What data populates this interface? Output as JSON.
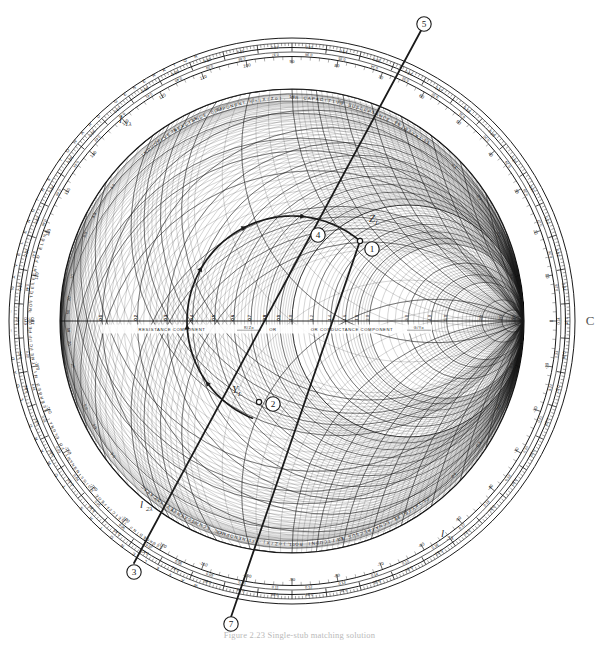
{
  "figure": {
    "kind": "smith-chart",
    "caption": "Figure 2.23  Single-stub matching solution",
    "background": "#ffffff",
    "ink": "#1a1a1a"
  },
  "chart_data": {
    "type": "scatter",
    "xlabel": "RESISTANCE COMPONENT (R/Zo), OR CONDUCTANCE COMPONENT (G/Yo)",
    "ylabel": "",
    "grid": true,
    "legend_position": "none",
    "axis_labels": {
      "center_axis": "RESISTANCE COMPONENT",
      "center_axis_paren": "R/Zo",
      "center_axis_or": "OR CONDUCTANCE COMPONENT",
      "center_axis_paren2": "G/Yo",
      "upper_rim": "INDUCTIVE REACTANCE COMPONENT (+jX/Zo), OR CAPACITIVE SUSCEPTANCE (+jB/Yo)",
      "lower_rim": "CAPACITIVE REACTANCE COMPONENT (-jX/Zo), OR INDUCTIVE SUSCEPTANCE (-jB/Yo)",
      "outer_ring_left": "WAVELENGTHS TOWARD GENERATOR",
      "outer_ring_right": "WAVELENGTHS TOWARD LOAD",
      "angle_ring_upper": "ANGLE OF REFLECTION COEFFICIENT IN DEGREES",
      "angle_ring_lower": "ANGLE OF TRANSMISSION COEFFICIENT IN DEGREES",
      "right_edge_letter": "C"
    },
    "center": {
      "x": 292,
      "y": 321
    },
    "outer_radius": 283,
    "resistance_ticks_right": [
      "0.1",
      "0.2",
      "0.3",
      "0.4",
      "0.5",
      "0.6",
      "0.7",
      "0.8",
      "0.9",
      "1.0",
      "1.2",
      "1.4",
      "1.6",
      "1.8",
      "2.0",
      "3.0",
      "4.0",
      "5.0",
      "10",
      "20",
      "50"
    ],
    "resistance_ticks_left_labels": [
      "0.9",
      "0.8",
      "0.7",
      "0.6",
      "0.5",
      "0.4",
      "0.3",
      "0.2",
      "0.1",
      "0"
    ],
    "reactance_labels": [
      "0.1",
      "0.2",
      "0.3",
      "0.4",
      "0.5",
      "0.6",
      "0.8",
      "1.0",
      "1.2",
      "1.4",
      "1.6",
      "1.8",
      "2.0",
      "3.0",
      "4.0",
      "5.0",
      "10",
      "20",
      "50"
    ],
    "wavelength_scale_top": [
      "0.09",
      "0.10",
      "0.11",
      "0.12",
      "0.13",
      "0.14",
      "0.15"
    ],
    "wavelength_scale_bottom": [
      "0.36",
      "0.37",
      "0.38",
      "0.39",
      "0.40"
    ],
    "angle_scale_top": [
      "100",
      "90",
      "80",
      "70"
    ],
    "swr_circle_radius": 152,
    "points": [
      {
        "id": 1,
        "label": "1",
        "x": 360,
        "y": 241,
        "kind": "open-dot",
        "note": "Z_L on SWR circle"
      },
      {
        "id": 2,
        "label": "2",
        "x": 259,
        "y": 402,
        "kind": "open-dot",
        "note": "Y_L on SWR circle"
      },
      {
        "id": 4,
        "label": "4",
        "x": 320,
        "y": 231,
        "kind": "open-dot",
        "note": "intersection with 1+jb circle"
      },
      {
        "id": 3,
        "label": "3",
        "x": 134,
        "y": 563,
        "kind": "rim-marker",
        "note": "rim reading, lower left"
      },
      {
        "id": 5,
        "label": "5",
        "x": 424,
        "y": 25,
        "kind": "rim-marker",
        "note": "rim reading, upper right"
      },
      {
        "id": 7,
        "label": "7",
        "x": 231,
        "y": 617,
        "kind": "rim-marker",
        "note": "rim reading, bottom"
      }
    ],
    "annotations": [
      {
        "text": "Z",
        "sub": "L",
        "x": 369,
        "y": 222
      },
      {
        "text": "Y",
        "sub": "L",
        "x": 232,
        "y": 393
      },
      {
        "text": "l",
        "sub": "1λ",
        "x": 119,
        "y": 123
      },
      {
        "text": "l",
        "sub": "2λ",
        "x": 140,
        "y": 508
      },
      {
        "text": "l",
        "sub": "3λ",
        "x": 441,
        "y": 537
      }
    ],
    "chords": [
      {
        "name": "chord-5-3",
        "from": [
          424,
          25
        ],
        "to": [
          134,
          563
        ]
      },
      {
        "name": "chord-1-7",
        "from": [
          360,
          241
        ],
        "to": [
          231,
          617
        ]
      }
    ],
    "arc": {
      "name": "constant-swr-arc",
      "from_point": 2,
      "to_point": 1,
      "direction": "counterclockwise",
      "arrow_count": 5
    }
  },
  "markers": {
    "m1": "1",
    "m2": "2",
    "m3": "3",
    "m4": "4",
    "m5": "5",
    "m7": "7"
  },
  "labels": {
    "zl_main": "Z",
    "zl_sub": "L",
    "yl_main": "Y",
    "yl_sub": "L",
    "l1_main": "l",
    "l1_sub": "1λ",
    "l2_main": "l",
    "l2_sub": "2λ",
    "l3_main": "l",
    "l3_sub": "3λ",
    "edge_c": "C"
  },
  "rim_text": {
    "wavelengths_gen": "WAVELENGTHS TOWARD GENERATOR",
    "wavelengths_load": "WAVELENGTHS TOWARD LOAD",
    "angle_refl": "ANGLE OF REFLECTION COEFFICIENT IN DEGREES",
    "angle_trans": "ANGLE OF TRANSMISSION COEFFICIENT IN DEGREES",
    "inductive": "INDUCTIVE REACTANCE COMPONENT (+jX/Zo), OR CAPACITIVE SUSCEPTANCE (+jB/Yo)",
    "capacitive": "CAPACITIVE REACTANCE COMPONENT (-jX/Zo), OR INDUCTIVE SUSCEPTANCE (-jB/Yo)",
    "center_left": "RESISTANCE COMPONENT",
    "center_right": "OR CONDUCTANCE COMPONENT",
    "frac_rz": "R/Zo",
    "frac_gy": "G/Yo"
  }
}
